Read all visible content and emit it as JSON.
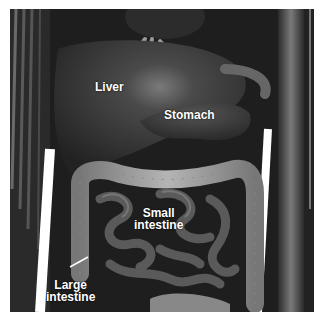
{
  "figure": {
    "labels": {
      "liver": "Liver",
      "stomach": "Stomach",
      "small_intestine_1": "Small",
      "small_intestine_2": "intestine",
      "large_intestine_1": "Large",
      "large_intestine_2": "intestine"
    },
    "colors": {
      "background": "#1a1a1a",
      "organ_dark": "#3a3a3a",
      "colon": "#a8a8a8",
      "label": "#ffffff"
    }
  }
}
